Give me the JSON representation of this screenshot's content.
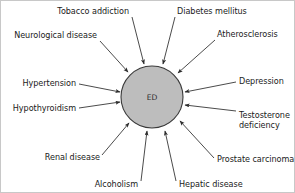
{
  "diagram": {
    "type": "radial-causal-diagram",
    "center": {
      "label": "ED",
      "shape": "circle",
      "fill_color": "#bdbdbd",
      "stroke_color": "#3a3a3a",
      "cx": 151,
      "cy": 96,
      "r": 31
    },
    "arrow_direction": "inward",
    "background_color": "#ffffff",
    "nodes": [
      {
        "id": "tobacco-addiction",
        "label": "Tobacco addiction",
        "lines": [
          "Tobacco addiction"
        ],
        "text_x": 128,
        "text_y": 13,
        "anchor": "end",
        "line_start_x": 131,
        "line_start_y": 16,
        "line_end_x": 143,
        "line_end_y": 63
      },
      {
        "id": "diabetes-mellitus",
        "label": "Diabetes mellitus",
        "lines": [
          "Diabetes mellitus"
        ],
        "text_x": 176,
        "text_y": 13,
        "anchor": "start",
        "line_start_x": 174,
        "line_start_y": 16,
        "line_end_x": 162,
        "line_end_y": 63
      },
      {
        "id": "neurological-disease",
        "label": "Neurological disease",
        "lines": [
          "Neurological disease"
        ],
        "text_x": 96,
        "text_y": 37,
        "anchor": "end",
        "line_start_x": 99,
        "line_start_y": 40,
        "line_end_x": 127,
        "line_end_y": 71
      },
      {
        "id": "atherosclerosis",
        "label": "Atherosclerosis",
        "lines": [
          "Atherosclerosis"
        ],
        "text_x": 216,
        "text_y": 36,
        "anchor": "start",
        "line_start_x": 214,
        "line_start_y": 39,
        "line_end_x": 177,
        "line_end_y": 72
      },
      {
        "id": "hypertension",
        "label": "Hypertension",
        "lines": [
          "Hypertension"
        ],
        "text_x": 75,
        "text_y": 85,
        "anchor": "end",
        "line_start_x": 78,
        "line_start_y": 83,
        "line_end_x": 119,
        "line_end_y": 91
      },
      {
        "id": "depression",
        "label": "Depression",
        "lines": [
          "Depression"
        ],
        "text_x": 238,
        "text_y": 83,
        "anchor": "start",
        "line_start_x": 235,
        "line_start_y": 81,
        "line_end_x": 184,
        "line_end_y": 91
      },
      {
        "id": "hypothyroidism",
        "label": "Hypothyroidism",
        "lines": [
          "Hypothyroidism"
        ],
        "text_x": 75,
        "text_y": 110,
        "anchor": "end",
        "line_start_x": 78,
        "line_start_y": 107,
        "line_end_x": 119,
        "line_end_y": 101
      },
      {
        "id": "testosterone-deficiency",
        "label": "Testosterone deficiency",
        "lines": [
          "Testosterone",
          "deficiency"
        ],
        "text_x": 238,
        "text_y": 117,
        "anchor": "start",
        "line_start_x": 235,
        "line_start_y": 110,
        "line_end_x": 184,
        "line_end_y": 104
      },
      {
        "id": "renal-disease",
        "label": "Renal disease",
        "lines": [
          "Renal disease"
        ],
        "text_x": 99,
        "text_y": 159,
        "anchor": "end",
        "line_start_x": 101,
        "line_start_y": 154,
        "line_end_x": 128,
        "line_end_y": 122
      },
      {
        "id": "prostate-carcinoma",
        "label": "Prostate carcinoma",
        "lines": [
          "Prostate carcinoma"
        ],
        "text_x": 216,
        "text_y": 161,
        "anchor": "start",
        "line_start_x": 213,
        "line_start_y": 157,
        "line_end_x": 179,
        "line_end_y": 120
      },
      {
        "id": "alcoholism",
        "label": "Alcoholism",
        "lines": [
          "Alcoholism"
        ],
        "text_x": 137,
        "text_y": 186,
        "anchor": "end",
        "line_start_x": 140,
        "line_start_y": 180,
        "line_end_x": 146,
        "line_end_y": 130
      },
      {
        "id": "hepatic-disease",
        "label": "Hepatic disease",
        "lines": [
          "Hepatic disease"
        ],
        "text_x": 178,
        "text_y": 186,
        "anchor": "start",
        "line_start_x": 175,
        "line_start_y": 180,
        "line_end_x": 164,
        "line_end_y": 130
      }
    ]
  }
}
